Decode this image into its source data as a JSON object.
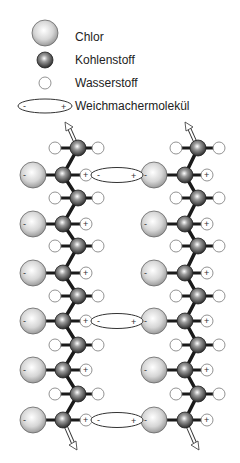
{
  "legend": {
    "items": [
      {
        "key": "chlorine",
        "label": "Chlor"
      },
      {
        "key": "carbon",
        "label": "Kohlenstoff"
      },
      {
        "key": "hydrogen",
        "label": "Wasserstoff"
      },
      {
        "key": "plasticizer",
        "label": "Weichmachermolekül"
      }
    ]
  },
  "signs": {
    "minus": "-",
    "plus": "+"
  },
  "colors": {
    "chlorine_fill": "#d9d9d9",
    "carbon_fill": "#7a7a7a",
    "hydrogen_fill": "#ffffff",
    "bond": "#1a1a1a",
    "outline": "#555555"
  }
}
